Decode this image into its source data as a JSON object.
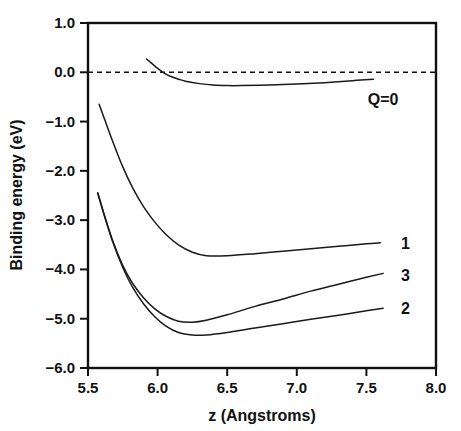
{
  "chart_data": {
    "type": "line",
    "title": "",
    "xlabel": "z (Angstroms)",
    "ylabel": "Binding energy (eV)",
    "xlim": [
      5.5,
      8.0
    ],
    "ylim": [
      -6.0,
      1.0
    ],
    "xticks": [
      "5.5",
      "6.0",
      "6.5",
      "7.0",
      "7.5",
      "8.0"
    ],
    "xtick_values": [
      5.5,
      6.0,
      6.5,
      7.0,
      7.5,
      8.0
    ],
    "yticks": [
      "1.0",
      "0.0",
      "-1.0",
      "-2.0",
      "-3.0",
      "-4.0",
      "-5.0",
      "-6.0"
    ],
    "ytick_values": [
      1.0,
      0.0,
      -1.0,
      -2.0,
      -3.0,
      -4.0,
      -5.0,
      -6.0
    ],
    "grid": false,
    "legend_position": "inline-right-of-curve",
    "annotations": [
      {
        "text": "Q=0",
        "x": 7.62,
        "y": -0.55
      },
      {
        "text": "1",
        "x": 7.78,
        "y": -3.47
      },
      {
        "text": "3",
        "x": 7.78,
        "y": -4.12
      },
      {
        "text": "2",
        "x": 7.78,
        "y": -4.78
      }
    ],
    "zero_reference_line": {
      "y": 0.0,
      "style": "dashed"
    },
    "series": [
      {
        "name": "Q=0",
        "label": "Q=0",
        "x": [
          5.92,
          5.95,
          6.0,
          6.05,
          6.1,
          6.15,
          6.2,
          6.3,
          6.4,
          6.5,
          6.6,
          6.8,
          7.0,
          7.2,
          7.4,
          7.55
        ],
        "values": [
          0.27,
          0.2,
          0.08,
          -0.02,
          -0.09,
          -0.14,
          -0.18,
          -0.23,
          -0.26,
          -0.27,
          -0.27,
          -0.26,
          -0.24,
          -0.21,
          -0.17,
          -0.14
        ]
      },
      {
        "name": "1",
        "label": "1",
        "x": [
          5.58,
          5.62,
          5.68,
          5.75,
          5.82,
          5.9,
          5.98,
          6.06,
          6.15,
          6.25,
          6.35,
          6.5,
          6.7,
          6.9,
          7.1,
          7.3,
          7.5,
          7.6
        ],
        "values": [
          -0.65,
          -0.96,
          -1.42,
          -1.92,
          -2.34,
          -2.73,
          -3.04,
          -3.29,
          -3.5,
          -3.65,
          -3.72,
          -3.72,
          -3.68,
          -3.63,
          -3.58,
          -3.53,
          -3.48,
          -3.46
        ]
      },
      {
        "name": "3",
        "label": "3",
        "x": [
          5.57,
          5.62,
          5.68,
          5.75,
          5.82,
          5.9,
          5.98,
          6.06,
          6.15,
          6.25,
          6.35,
          6.5,
          6.7,
          6.9,
          7.1,
          7.3,
          7.5,
          7.62
        ],
        "values": [
          -2.45,
          -2.92,
          -3.44,
          -3.92,
          -4.28,
          -4.58,
          -4.8,
          -4.95,
          -5.05,
          -5.07,
          -5.03,
          -4.92,
          -4.75,
          -4.6,
          -4.44,
          -4.3,
          -4.16,
          -4.08
        ]
      },
      {
        "name": "2",
        "label": "2",
        "x": [
          5.57,
          5.62,
          5.68,
          5.75,
          5.82,
          5.9,
          5.98,
          6.06,
          6.15,
          6.25,
          6.35,
          6.5,
          6.7,
          6.9,
          7.1,
          7.3,
          7.5,
          7.62
        ],
        "values": [
          -2.45,
          -2.93,
          -3.46,
          -3.96,
          -4.36,
          -4.7,
          -4.96,
          -5.15,
          -5.28,
          -5.33,
          -5.33,
          -5.28,
          -5.19,
          -5.1,
          -5.01,
          -4.93,
          -4.84,
          -4.79
        ]
      }
    ]
  },
  "axes": {
    "x_title": "z (Angstroms)",
    "y_title": "Binding energy (eV)"
  }
}
